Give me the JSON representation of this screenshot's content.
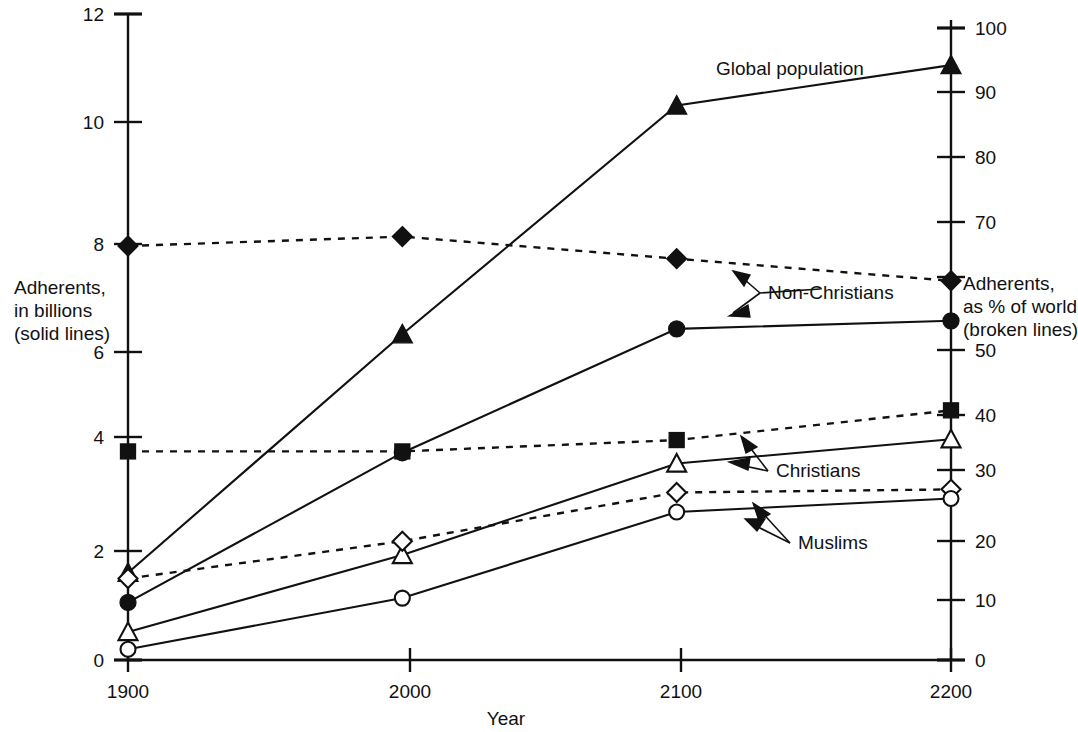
{
  "chart_data": {
    "type": "line",
    "title": "",
    "xlabel": "Year",
    "ylabel_left": "Adherents,\nin billions\n(solid lines)",
    "ylabel_right": "Adherents,\nas % of world\n(broken lines)",
    "x": [
      1900,
      2000,
      2100,
      2200
    ],
    "xticklabels": [
      "1900",
      "2000",
      "2100",
      "2200"
    ],
    "xlim": [
      1900,
      2200
    ],
    "ylim_left": [
      0,
      12
    ],
    "yticks_left": [
      0,
      2,
      4,
      6,
      8,
      10,
      12
    ],
    "yticklabels_left": [
      "0",
      "2",
      "4",
      "6",
      "8",
      "10",
      "12"
    ],
    "ylim_right": [
      0,
      100
    ],
    "yticks_right": [
      0,
      10,
      20,
      30,
      40,
      50,
      60,
      70,
      80,
      90,
      100
    ],
    "yticklabels_right": [
      "0",
      "10",
      "20",
      "30",
      "40",
      "50",
      "60",
      "70",
      "80",
      "90",
      "100"
    ],
    "grid": false,
    "legend": "inline-annotations",
    "series": [
      {
        "name": "Global population",
        "axis": "left",
        "linestyle": "solid",
        "marker": "filled-triangle",
        "values": [
          1.62,
          6.05,
          10.3,
          11.05
        ]
      },
      {
        "name": "Non-Christians (% of world)",
        "axis": "right",
        "linestyle": "dashed",
        "marker": "filled-diamond",
        "values": [
          65.5,
          67.0,
          63.5,
          60.0
        ]
      },
      {
        "name": "Non-Christians (billions)",
        "axis": "left",
        "linestyle": "solid",
        "marker": "filled-circle",
        "values": [
          1.07,
          3.85,
          6.15,
          6.3
        ]
      },
      {
        "name": "Christians (% of world)",
        "axis": "right",
        "linestyle": "dashed",
        "marker": "filled-square",
        "values": [
          33.0,
          33.0,
          34.8,
          39.5
        ]
      },
      {
        "name": "Christians (billions)",
        "axis": "left",
        "linestyle": "solid",
        "marker": "open-triangle",
        "values": [
          0.52,
          1.95,
          3.65,
          4.1
        ]
      },
      {
        "name": "Muslims (% of world)",
        "axis": "right",
        "linestyle": "dashed",
        "marker": "open-diamond",
        "values": [
          12.9,
          18.8,
          26.5,
          27.0
        ]
      },
      {
        "name": "Muslims (billions)",
        "axis": "left",
        "linestyle": "solid",
        "marker": "open-circle",
        "values": [
          0.2,
          1.15,
          2.75,
          3.0
        ]
      }
    ],
    "annotations": [
      {
        "text": "Global population",
        "x": 810,
        "y": 70
      },
      {
        "text": "Non-Christians",
        "x": 826,
        "y": 293
      },
      {
        "text": "Christians",
        "x": 826,
        "y": 470
      },
      {
        "text": "Muslims",
        "x": 832,
        "y": 543
      }
    ]
  },
  "axes": {
    "left_title_line1": "Adherents,",
    "left_title_line2": "in billions",
    "left_title_line3": "(solid lines)",
    "right_title_line1": "Adherents,",
    "right_title_line2": "as % of world",
    "right_title_line3": "(broken lines)",
    "x_title": "Year"
  },
  "labels": {
    "global_population": "Global population",
    "non_christians": "Non-Christians",
    "christians": "Christians",
    "muslims": "Muslims"
  },
  "left_ticks": [
    {
      "label": "12",
      "y": 14
    },
    {
      "label": "10",
      "y": 122
    },
    {
      "label": "8",
      "y": 244
    },
    {
      "label": "6",
      "y": 352
    },
    {
      "label": "4",
      "y": 437
    },
    {
      "label": "2",
      "y": 551
    },
    {
      "label": "0",
      "y": 660
    }
  ],
  "right_ticks": [
    {
      "label": "100",
      "y": 28
    },
    {
      "label": "90",
      "y": 92
    },
    {
      "label": "80",
      "y": 157
    },
    {
      "label": "70",
      "y": 222
    },
    {
      "label": "60",
      "y": 277
    },
    {
      "label": "50",
      "y": 350
    },
    {
      "label": "40",
      "y": 415
    },
    {
      "label": "30",
      "y": 470
    },
    {
      "label": "20",
      "y": 541
    },
    {
      "label": "10",
      "y": 600
    },
    {
      "label": "0",
      "y": 660
    }
  ],
  "x_ticks": [
    {
      "label": "1900",
      "x": 128
    },
    {
      "label": "2000",
      "x": 410
    },
    {
      "label": "2100",
      "x": 681
    },
    {
      "label": "2200",
      "x": 951
    }
  ],
  "colors": {
    "ink": "#111111",
    "background": "#ffffff"
  }
}
